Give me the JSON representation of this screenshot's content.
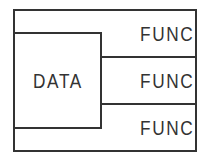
{
  "diagram": {
    "data_block": {
      "label": "DATA"
    },
    "func_blocks": [
      {
        "label": "FUNC"
      },
      {
        "label": "FUNC"
      },
      {
        "label": "FUNC"
      }
    ]
  },
  "colors": {
    "stroke": "#333333",
    "text": "#333333",
    "background": "#ffffff"
  }
}
